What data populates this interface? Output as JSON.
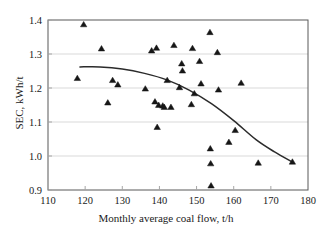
{
  "chart_data": {
    "type": "scatter",
    "title": "",
    "xlabel": "Monthly average coal flow, t/h",
    "ylabel": "SEC, kWh/t",
    "xlim": [
      110,
      180
    ],
    "ylim": [
      0.9,
      1.4
    ],
    "xticks": [
      110,
      120,
      130,
      140,
      150,
      160,
      170,
      180
    ],
    "yticks": [
      "0.9",
      "1.0",
      "1.1",
      "1.2",
      "1.3",
      "1.4"
    ],
    "grid": "horizontal",
    "legend": "none",
    "marker": "triangle",
    "marker_color": "#161616",
    "series": [
      {
        "name": "Monthly observations",
        "type": "scatter",
        "points": [
          [
            117.9,
            1.228
          ],
          [
            119.6,
            1.386
          ],
          [
            124.4,
            1.315
          ],
          [
            126.1,
            1.156
          ],
          [
            127.4,
            1.222
          ],
          [
            128.8,
            1.209
          ],
          [
            136.2,
            1.197
          ],
          [
            137.9,
            1.309
          ],
          [
            138.8,
            1.159
          ],
          [
            139.2,
            1.317
          ],
          [
            139.4,
            1.084
          ],
          [
            139.8,
            1.149
          ],
          [
            140.9,
            1.147
          ],
          [
            141.3,
            1.143
          ],
          [
            142.1,
            1.222
          ],
          [
            143.1,
            1.143
          ],
          [
            143.9,
            1.325
          ],
          [
            145.4,
            1.201
          ],
          [
            146.0,
            1.271
          ],
          [
            146.2,
            1.25
          ],
          [
            148.6,
            1.151
          ],
          [
            148.9,
            1.316
          ],
          [
            149.4,
            1.183
          ],
          [
            150.8,
            1.278
          ],
          [
            151.2,
            1.212
          ],
          [
            153.6,
            1.363
          ],
          [
            153.7,
            1.021
          ],
          [
            153.8,
            0.977
          ],
          [
            153.9,
            0.912
          ],
          [
            155.6,
            1.304
          ],
          [
            155.9,
            1.194
          ],
          [
            158.7,
            1.04
          ],
          [
            160.4,
            1.075
          ],
          [
            162.0,
            1.214
          ],
          [
            166.6,
            0.979
          ],
          [
            175.8,
            0.982
          ]
        ]
      },
      {
        "name": "Fitted trend",
        "type": "line",
        "points": [
          [
            118.6,
            1.262
          ],
          [
            124.0,
            1.262
          ],
          [
            130.0,
            1.256
          ],
          [
            136.0,
            1.243
          ],
          [
            142.0,
            1.224
          ],
          [
            148.0,
            1.194
          ],
          [
            154.0,
            1.154
          ],
          [
            160.0,
            1.104
          ],
          [
            166.0,
            1.048
          ],
          [
            171.0,
            1.012
          ],
          [
            175.8,
            0.982
          ]
        ]
      }
    ]
  }
}
